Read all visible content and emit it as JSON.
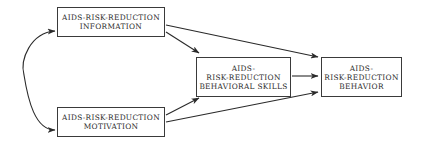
{
  "diagram": {
    "nodes": [
      {
        "id": "information",
        "lines": [
          "AIDS-RISK-REDUCTION",
          "INFORMATION"
        ]
      },
      {
        "id": "motivation",
        "lines": [
          "AIDS-RISK-REDUCTION",
          "MOTIVATION"
        ]
      },
      {
        "id": "behavioral_skills",
        "lines": [
          "AIDS-",
          "RISK-REDUCTION",
          "BEHAVIORAL SKILLS"
        ]
      },
      {
        "id": "behavior",
        "lines": [
          "AIDS-",
          "RISK-REDUCTION",
          "BEHAVIOR"
        ]
      }
    ],
    "edges": [
      {
        "from": "information",
        "to": "motivation",
        "type": "bidirectional-curved"
      },
      {
        "from": "information",
        "to": "behavioral_skills",
        "type": "directed"
      },
      {
        "from": "information",
        "to": "behavior",
        "type": "directed"
      },
      {
        "from": "motivation",
        "to": "behavioral_skills",
        "type": "directed"
      },
      {
        "from": "motivation",
        "to": "behavior",
        "type": "directed"
      },
      {
        "from": "behavioral_skills",
        "to": "behavior",
        "type": "directed"
      }
    ],
    "colors": {
      "stroke": "#2a2a2a",
      "background": "#ffffff"
    }
  }
}
